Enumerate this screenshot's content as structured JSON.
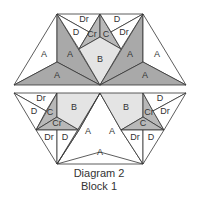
{
  "colors": {
    "dark": "#a9a9a9",
    "medium": "#b8b8b8",
    "light": "#e4e4e4",
    "white": "#ffffff",
    "stroke": "#333333"
  },
  "caption": {
    "line1": "Diagram 2",
    "line2": "Block 1"
  },
  "upper_half": {
    "pieces": [
      {
        "label": "A",
        "fill": "white",
        "points": "14,85 57,14 57,62",
        "lx": 44,
        "ly": 55
      },
      {
        "label": "A",
        "fill": "dark",
        "points": "57,14 57,62 100,85",
        "lx": 70,
        "ly": 55
      },
      {
        "label": "A",
        "fill": "dark",
        "points": "14,85 57,62 100,85",
        "lx": 57,
        "ly": 76
      },
      {
        "label": "Dr",
        "fill": "white",
        "points": "57,14 100,14 89,32",
        "lx": 84,
        "ly": 20
      },
      {
        "label": "D",
        "fill": "white",
        "points": "57,14 89,32 79,49",
        "lx": 76,
        "ly": 33
      },
      {
        "label": "Cr",
        "fill": "medium",
        "points": "100,14 79,49 100,37",
        "lx": 92,
        "ly": 35
      },
      {
        "label": "C",
        "fill": "medium",
        "points": "100,14 100,37 121,49",
        "lx": 106,
        "ly": 35
      },
      {
        "label": "B",
        "fill": "light",
        "points": "79,49 100,37 121,49 100,85",
        "lx": 100,
        "ly": 60
      },
      {
        "label": "D",
        "fill": "white",
        "points": "100,14 143,14 111,32",
        "lx": 117,
        "ly": 20
      },
      {
        "label": "Dr",
        "fill": "white",
        "points": "143,14 111,32 121,49",
        "lx": 124,
        "ly": 33
      },
      {
        "label": "A",
        "fill": "dark",
        "points": "143,14 143,62 100,85",
        "lx": 130,
        "ly": 55
      },
      {
        "label": "A",
        "fill": "white",
        "points": "186,85 143,14 143,62",
        "lx": 157,
        "ly": 55
      },
      {
        "label": "A",
        "fill": "dark",
        "points": "186,85 143,62 100,85",
        "lx": 145,
        "ly": 76
      }
    ]
  },
  "lower_half": {
    "pieces": [
      {
        "label": "Dr",
        "fill": "white",
        "points": "14,93 57,93 46,111",
        "lx": 41,
        "ly": 99
      },
      {
        "label": "D",
        "fill": "white",
        "points": "14,93 46,111 36,130",
        "lx": 34,
        "ly": 112
      },
      {
        "label": "C",
        "fill": "medium",
        "points": "57,93 36,130 57,117",
        "lx": 50,
        "ly": 113
      },
      {
        "label": "Cr",
        "fill": "medium",
        "points": "36,130 57,117 79,130",
        "lx": 57,
        "ly": 124
      },
      {
        "label": "B",
        "fill": "light",
        "points": "57,93 100,93 79,130 57,117",
        "lx": 74,
        "ly": 108
      },
      {
        "label": "Dr",
        "fill": "white",
        "points": "36,130 57,130 57,164",
        "lx": 49,
        "ly": 138
      },
      {
        "label": "D",
        "fill": "white",
        "points": "57,130 79,130 57,164",
        "lx": 65,
        "ly": 138
      },
      {
        "label": "A",
        "fill": "dark",
        "points": "100,93 79,130 57,164",
        "lx": 88,
        "ly": 132
      },
      {
        "label": "A",
        "fill": "dark",
        "points": "100,93 121,130 143,164",
        "lx": 112,
        "ly": 132
      },
      {
        "label": "A",
        "fill": "white",
        "points": "57,164 100,152 143,164",
        "lx": 100,
        "ly": 153
      },
      {
        "label": "B",
        "fill": "light",
        "points": "100,93 143,93 143,117 121,130",
        "lx": 126,
        "ly": 108
      },
      {
        "label": "Cr",
        "fill": "medium",
        "points": "143,93 143,117 164,130",
        "lx": 149,
        "ly": 113
      },
      {
        "label": "C",
        "fill": "medium",
        "points": "121,130 143,117 164,130",
        "lx": 143,
        "ly": 124
      },
      {
        "label": "D",
        "fill": "white",
        "points": "143,93 186,93 153,111",
        "lx": 160,
        "ly": 99
      },
      {
        "label": "Dr",
        "fill": "white",
        "points": "186,93 153,111 164,130",
        "lx": 165,
        "ly": 112
      },
      {
        "label": "Dr",
        "fill": "white",
        "points": "121,130 143,130 143,164",
        "lx": 135,
        "ly": 138
      },
      {
        "label": "D",
        "fill": "white",
        "points": "143,130 164,130 143,164",
        "lx": 151,
        "ly": 138
      }
    ]
  }
}
